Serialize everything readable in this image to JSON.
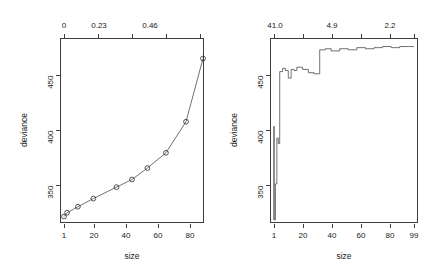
{
  "figure": {
    "background": "#ffffff",
    "line_color": "#4d4d4d",
    "axis_color": "#3d3d3d",
    "text_color": "#1a1a1a"
  },
  "chart_data": [
    {
      "type": "line",
      "id": "left-panel",
      "title": "",
      "xlabel": "size",
      "ylabel": "deviance",
      "grid": false,
      "legend": null,
      "x_axis": {
        "position": "bottom",
        "tick_labels": [
          "1",
          "20",
          "40",
          "60",
          "80"
        ],
        "tick_values": [
          1,
          20,
          40,
          60,
          80
        ],
        "range": [
          1,
          91
        ]
      },
      "x_axis_top": {
        "position": "top",
        "label": "",
        "tick_labels": [
          "0",
          "0.23",
          "0.46",
          "",
          ""
        ],
        "tick_values": [
          0,
          0.23,
          0.46,
          null,
          null
        ],
        "note": "cost-complexity parameter k"
      },
      "y_axis": {
        "tick_labels": [
          "350",
          "400",
          "450"
        ],
        "tick_values": [
          350,
          400,
          450
        ],
        "range": [
          320,
          487
        ]
      },
      "x": [
        1,
        2,
        5,
        11,
        20,
        35,
        45,
        55,
        67,
        80,
        91
      ],
      "series": [
        {
          "name": "deviance",
          "marker": "open-circle",
          "x": [
            1,
            3,
            10,
            20,
            35,
            45,
            55,
            67,
            80,
            91
          ],
          "values": [
            325,
            328.5,
            334,
            341.5,
            352,
            359,
            369.5,
            383.5,
            412,
            470
          ]
        }
      ]
    },
    {
      "type": "line",
      "id": "right-panel",
      "title": "",
      "xlabel": "size",
      "ylabel": "deviance",
      "grid": false,
      "legend": null,
      "step": true,
      "x_axis": {
        "position": "bottom",
        "tick_labels": [
          "1",
          "20",
          "40",
          "60",
          "80",
          "99"
        ],
        "tick_values": [
          1,
          20,
          40,
          60,
          80,
          99
        ],
        "range": [
          1,
          99
        ]
      },
      "x_axis_top": {
        "position": "top",
        "label": "",
        "tick_labels": [
          "41.0",
          "",
          "4.9",
          "",
          "2.2",
          ""
        ],
        "tick_values": [
          41.0,
          null,
          4.9,
          null,
          2.2,
          null
        ],
        "note": "cost-complexity parameter k"
      },
      "y_axis": {
        "tick_labels": [
          "350",
          "400",
          "450"
        ],
        "tick_values": [
          350,
          400,
          450
        ],
        "range": [
          320,
          487
        ]
      },
      "series": [
        {
          "name": "cv deviance",
          "marker": "none",
          "x": [
            1,
            1,
            1,
            2,
            2,
            3,
            3,
            4,
            4,
            5,
            5,
            7,
            7,
            9,
            9,
            11,
            11,
            13,
            13,
            15,
            15,
            17,
            17,
            21,
            21,
            25,
            25,
            29,
            29,
            33,
            33,
            37,
            37,
            41,
            41,
            47,
            47,
            53,
            53,
            59,
            59,
            65,
            65,
            71,
            71,
            77,
            77,
            83,
            83,
            89,
            89,
            95,
            95,
            99
          ],
          "values": [
            322,
            408,
            322,
            322,
            355,
            355,
            397,
            397,
            392,
            392,
            458,
            458,
            461,
            461,
            459,
            459,
            452,
            452,
            460,
            460,
            459,
            459,
            462,
            462,
            460,
            460,
            457,
            457,
            456,
            456,
            478,
            478,
            479,
            479,
            477,
            477,
            479,
            479,
            478,
            478,
            480,
            480,
            479,
            479,
            480,
            480,
            481,
            481,
            480,
            480,
            481,
            481,
            481,
            481
          ]
        }
      ]
    }
  ]
}
